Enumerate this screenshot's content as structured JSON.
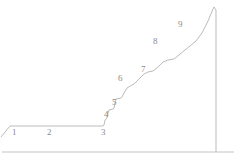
{
  "figure": {
    "name": "stepped-elevation-profile",
    "background_color": "#ffffff",
    "line_color": "#a9a9a9",
    "label_color": "#8a8a8a",
    "baseline_color": "#b5b5b5",
    "line_width": 0.8,
    "width": 236,
    "height": 160
  },
  "baseline": {
    "label": "bottom-rule",
    "x1": 2,
    "y1": 152,
    "x2": 234,
    "y2": 152
  },
  "profile": {
    "description": "Polyline profile: short left ramp, long flat terrace, ascending staircase of risers and treads, apex, vertical right drop.",
    "points": "1,137 10,126 103,126 104,125 105,120 107,118 108,113 109,110 113,109 114,108 115,103 116,99 121,98 122,97 124,93 127,88 132,85 134,84 139,79 144,74 148,72 153,71 158,67 163,62 168,60 174,59 179,55 185,50 190,46 196,41 202,33 208,21 213,9 214,7 216,10 216,152"
  },
  "labels": [
    {
      "id": "segment-label-1",
      "text": "1",
      "x": 12,
      "y": 128
    },
    {
      "id": "segment-label-2",
      "text": "2",
      "x": 47,
      "y": 128
    },
    {
      "id": "segment-label-3",
      "text": "3",
      "x": 101,
      "y": 128
    },
    {
      "id": "segment-label-4",
      "text": "4",
      "x": 104,
      "y": 110
    },
    {
      "id": "segment-label-5",
      "text": "5",
      "x": 112,
      "y": 98
    },
    {
      "id": "segment-label-6",
      "text": "6",
      "x": 118,
      "y": 74
    },
    {
      "id": "segment-label-7",
      "text": "7",
      "x": 141,
      "y": 65
    },
    {
      "id": "segment-label-8",
      "text": "8",
      "x": 153,
      "y": 37
    },
    {
      "id": "segment-label-9",
      "text": "9",
      "x": 178,
      "y": 20
    }
  ]
}
